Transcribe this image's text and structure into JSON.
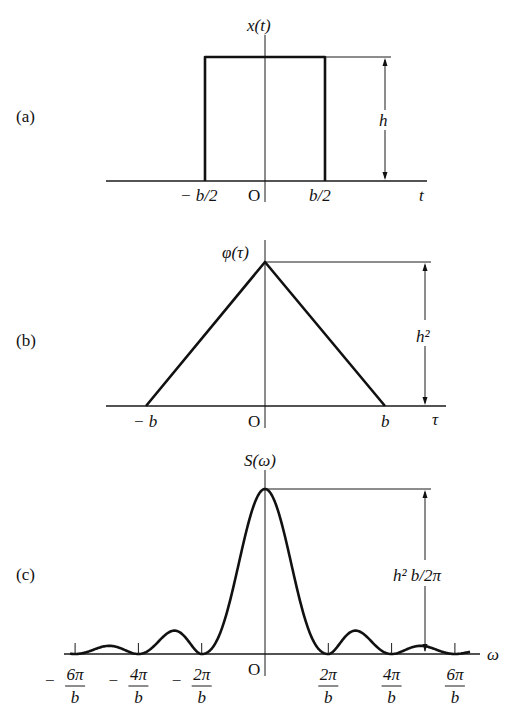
{
  "panels": {
    "a": {
      "tag": "(a)",
      "ylabel": "x(t)",
      "xlabel": "t",
      "ticks": [
        "− b/2",
        "O",
        "b/2"
      ],
      "height_label": "h"
    },
    "b": {
      "tag": "(b)",
      "ylabel": "φ(τ)",
      "xlabel": "τ",
      "ticks": [
        "− b",
        "O",
        "b"
      ],
      "height_label": "h²"
    },
    "c": {
      "tag": "(c)",
      "ylabel": "S(ω)",
      "xlabel": "ω",
      "origin": "O",
      "height_label": "h² b/2π",
      "ticks": [
        {
          "sign": "−",
          "num": "6π",
          "den": "b"
        },
        {
          "sign": "−",
          "num": "4π",
          "den": "b"
        },
        {
          "sign": "−",
          "num": "2π",
          "den": "b"
        },
        {
          "sign": "",
          "num": "2π",
          "den": "b"
        },
        {
          "sign": "",
          "num": "4π",
          "den": "b"
        },
        {
          "sign": "",
          "num": "6π",
          "den": "b"
        }
      ]
    }
  },
  "chart_data": [
    {
      "type": "line",
      "title": "(a) Rectangular pulse x(t)",
      "xlabel": "t",
      "ylabel": "x(t)",
      "x": [
        "-inf",
        "-b/2",
        "-b/2",
        "b/2",
        "b/2",
        "inf"
      ],
      "values": [
        0,
        0,
        "h",
        "h",
        0,
        0
      ],
      "annotations": [
        "h (pulse height)"
      ],
      "grid": false
    },
    {
      "type": "line",
      "title": "(b) Autocorrelation φ(τ)",
      "xlabel": "τ",
      "ylabel": "φ(τ)",
      "x": [
        "-b",
        "0",
        "b"
      ],
      "values": [
        0,
        "h^2",
        0
      ],
      "annotations": [
        "h² (peak height)"
      ],
      "grid": false
    },
    {
      "type": "line",
      "title": "(c) Power spectral density S(ω)",
      "xlabel": "ω",
      "ylabel": "S(ω)",
      "formula": "S(ω) = (h² b / 2π) · [sin(ωb/2)/(ωb/2)]²",
      "x_ticks": [
        "-6π/b",
        "-4π/b",
        "-2π/b",
        "0",
        "2π/b",
        "4π/b",
        "6π/b"
      ],
      "zeros": [
        "±2π/b",
        "±4π/b",
        "±6π/b"
      ],
      "peak": {
        "x": 0,
        "value": "h²b/2π"
      },
      "annotations": [
        "h² b/2π (peak height)"
      ],
      "grid": false
    }
  ]
}
